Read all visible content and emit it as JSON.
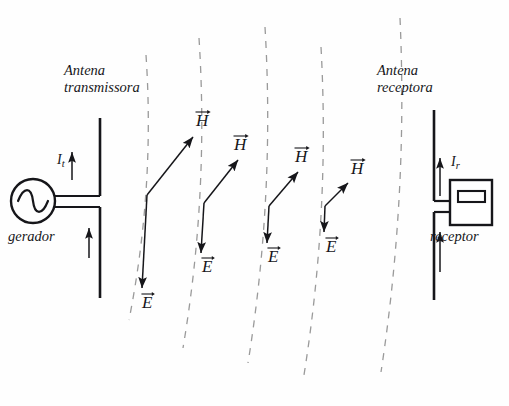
{
  "figure": {
    "kind": "electromagnetic-wave-propagation-diagram",
    "background_color": "#fefefe",
    "ink_color": "#16161a",
    "wavefront_color": "#9a9a9a"
  },
  "labels": {
    "transmit_antenna_line1": "Antena",
    "transmit_antenna_line2": "transmissora",
    "receive_antenna_line1": "Antena",
    "receive_antenna_line2": "receptora",
    "generator": "gerador",
    "receiver": "receptor",
    "transmit_current_symbol": "I",
    "transmit_current_subscript": "t",
    "receive_current_symbol": "I",
    "receive_current_subscript": "r",
    "field_electric": "E",
    "field_magnetic": "H"
  },
  "transmitter": {
    "antenna_x": 100,
    "antenna_top_y": 118,
    "antenna_bottom_y": 298,
    "feed_gap_top_y": 196,
    "feed_gap_bottom_y": 207,
    "generator_center_x": 33,
    "generator_center_y": 201,
    "generator_radius": 22,
    "current_arrow_upper": {
      "x": 72,
      "y_tail": 180,
      "y_head": 152
    },
    "current_arrow_lower": {
      "x": 89,
      "y_tail": 258,
      "y_head": 228
    }
  },
  "receiver": {
    "antenna_x": 434,
    "antenna_top_y": 110,
    "antenna_bottom_y": 300,
    "feed_gap_top_y": 201,
    "feed_gap_bottom_y": 212,
    "box": {
      "x": 450,
      "y": 180,
      "width": 42,
      "height": 45
    },
    "box_inner": {
      "x": 458,
      "y": 191,
      "width": 27,
      "height": 11
    },
    "current_arrow_upper": {
      "x": 440,
      "y_tail": 196,
      "y_head": 158
    },
    "current_arrow_lower": {
      "x": 440,
      "y_tail": 272,
      "y_head": 232
    }
  },
  "wavefronts": [
    {
      "index": 1,
      "x_top": 146,
      "x_mid": 151,
      "x_bottom": 129,
      "y_top": 55,
      "y_bottom": 320
    },
    {
      "index": 2,
      "x_top": 199,
      "x_mid": 205,
      "x_bottom": 183,
      "y_top": 38,
      "y_bottom": 348
    },
    {
      "index": 3,
      "x_top": 265,
      "x_mid": 271,
      "x_bottom": 248,
      "y_top": 27,
      "y_bottom": 363
    },
    {
      "index": 4,
      "x_top": 321,
      "x_mid": 326,
      "x_bottom": 304,
      "y_top": 47,
      "y_bottom": 375
    },
    {
      "index": 5,
      "x_top": 400,
      "x_mid": 404,
      "x_bottom": 381,
      "y_top": 18,
      "y_bottom": 372
    }
  ],
  "field_vector_pairs": [
    {
      "index": 1,
      "origin": {
        "x": 147,
        "y": 195
      },
      "magnetic_tip": {
        "x": 193,
        "y": 137
      },
      "electric_tip": {
        "x": 142,
        "y": 288
      },
      "h_label": {
        "x": 196,
        "y": 110
      },
      "e_label": {
        "x": 142,
        "y": 292
      }
    },
    {
      "index": 2,
      "origin": {
        "x": 204,
        "y": 203
      },
      "magnetic_tip": {
        "x": 238,
        "y": 160
      },
      "electric_tip": {
        "x": 201,
        "y": 253
      },
      "h_label": {
        "x": 234,
        "y": 134
      },
      "e_label": {
        "x": 202,
        "y": 256
      }
    },
    {
      "index": 3,
      "origin": {
        "x": 269,
        "y": 206
      },
      "magnetic_tip": {
        "x": 298,
        "y": 172
      },
      "electric_tip": {
        "x": 267,
        "y": 243
      },
      "h_label": {
        "x": 295,
        "y": 146
      },
      "e_label": {
        "x": 268,
        "y": 246
      }
    },
    {
      "index": 4,
      "origin": {
        "x": 325,
        "y": 206
      },
      "magnetic_tip": {
        "x": 348,
        "y": 183
      },
      "electric_tip": {
        "x": 324,
        "y": 232
      },
      "h_label": {
        "x": 351,
        "y": 158
      },
      "e_label": {
        "x": 326,
        "y": 236
      }
    }
  ]
}
